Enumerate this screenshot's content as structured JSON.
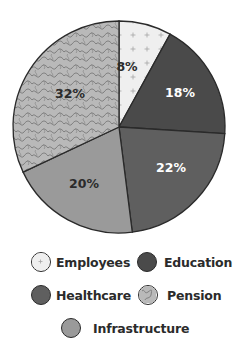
{
  "chart_data": {
    "type": "pie",
    "title": "",
    "start_angle_deg": 0,
    "direction": "clockwise",
    "slices": [
      {
        "label": "Employees",
        "value": 8,
        "display": "8%",
        "color": "#efefef",
        "pattern": "plus",
        "text_color": "#2b2b2b"
      },
      {
        "label": "Education",
        "value": 18,
        "display": "18%",
        "color": "#4a4a4a",
        "pattern": "none",
        "text_color": "#ffffff"
      },
      {
        "label": "Healthcare",
        "value": 22,
        "display": "22%",
        "color": "#5f5f5f",
        "pattern": "none",
        "text_color": "#ffffff"
      },
      {
        "label": "Infrastructure",
        "value": 20,
        "display": "20%",
        "color": "#9a9a9a",
        "pattern": "none",
        "text_color": "#2b2b2b"
      },
      {
        "label": "Pension",
        "value": 32,
        "display": "32%",
        "color": "#b9b9b9",
        "pattern": "squiggle",
        "text_color": "#2b2b2b"
      }
    ],
    "categories": [
      "Employees",
      "Education",
      "Healthcare",
      "Infrastructure",
      "Pension"
    ],
    "values": [
      8,
      18,
      22,
      20,
      32
    ],
    "legend": {
      "position": "bottom",
      "entries": [
        "Employees",
        "Education",
        "Healthcare",
        "Pension",
        "Infrastructure"
      ]
    }
  },
  "legend": {
    "employees": "Employees",
    "education": "Education",
    "healthcare": "Healthcare",
    "pension": "Pension",
    "infrastructure": "Infrastructure"
  },
  "colors": {
    "outline": "#2a2a2a",
    "employees": "#efefef",
    "education": "#4a4a4a",
    "healthcare": "#5f5f5f",
    "infrastructure": "#9a9a9a",
    "pension": "#b9b9b9",
    "pension_squiggle": "#7d7d7d",
    "employees_plus": "#9a9a9a"
  }
}
